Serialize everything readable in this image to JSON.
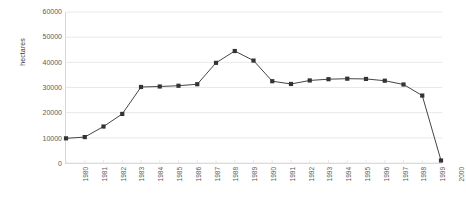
{
  "chart_data": {
    "type": "line",
    "title": "",
    "subtitle": "",
    "xlabel": "",
    "ylabel": "hectares",
    "categories": [
      "1980",
      "1981",
      "1982",
      "1983",
      "1984",
      "1985",
      "1986",
      "1987",
      "1988",
      "1989",
      "1990",
      "1991",
      "1992",
      "1993",
      "1994",
      "1995",
      "1996",
      "1997",
      "1998",
      "1999",
      "2000"
    ],
    "values": [
      9800,
      10300,
      14500,
      19500,
      30200,
      30400,
      30700,
      31300,
      39800,
      44500,
      40700,
      32500,
      31400,
      32800,
      33300,
      33500,
      33400,
      32700,
      31200,
      26800,
      1000
    ],
    "series": [
      {
        "name": "hectares",
        "values": [
          9800,
          10300,
          14500,
          19500,
          30200,
          30400,
          30700,
          31300,
          39800,
          44500,
          40700,
          32500,
          31400,
          32800,
          33300,
          33500,
          33400,
          32700,
          31200,
          26800,
          1000
        ]
      }
    ],
    "ylim": [
      0,
      60000
    ],
    "yticks": [
      0,
      10000,
      20000,
      30000,
      40000,
      50000,
      60000
    ],
    "ytick_labels": [
      "0",
      "10000",
      "20000",
      "30000",
      "40000",
      "50000",
      "60000"
    ],
    "grid": true,
    "grid_axis": "y",
    "legend": false,
    "legend_position": "none",
    "marker": "square",
    "marker_color": "#333333",
    "line_color": "#444444",
    "grid_color": "#e8e8e8",
    "axis_color": "#cfcfcf",
    "background_color": "#ffffff",
    "text_color": "#5a5a5a",
    "xtick_rotation": -90
  }
}
